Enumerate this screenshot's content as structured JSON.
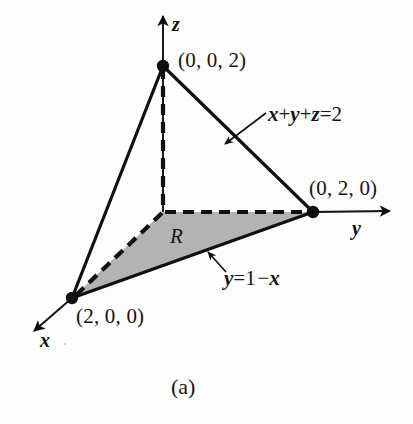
{
  "figure": {
    "caption": "(a)",
    "kind": "3d-coordinate-diagram",
    "background_color": "#fdfdfd",
    "stroke_color": "#101010",
    "shaded_region_color": "#b3b3b3"
  },
  "axes": [
    {
      "name": "z",
      "label": "z",
      "label_x": 172,
      "label_y": 14,
      "from_x": 163,
      "from_y": 212,
      "to_x": 163,
      "to_y": 16
    },
    {
      "name": "y",
      "label": "y",
      "label_x": 352,
      "label_y": 218,
      "from_x": 313,
      "from_y": 212,
      "to_x": 390,
      "to_y": 211
    },
    {
      "name": "x",
      "label": "x",
      "label_x": 40,
      "label_y": 330,
      "from_x": 72,
      "from_y": 298,
      "to_x": 34,
      "to_y": 331
    }
  ],
  "vertices": [
    {
      "name": "z-intercept",
      "label": "(0, 0, 2)",
      "px": 163,
      "py": 66,
      "label_x": 178,
      "label_y": 50
    },
    {
      "name": "y-intercept",
      "label": "(0, 2, 0)",
      "px": 313,
      "py": 212,
      "label_x": 309,
      "label_y": 178
    },
    {
      "name": "x-intercept",
      "label": "(2, 0, 0)",
      "px": 72,
      "py": 298,
      "label_x": 76,
      "label_y": 306
    },
    {
      "name": "origin",
      "label": "",
      "px": 163,
      "py": 212,
      "label_x": 0,
      "label_y": 0
    }
  ],
  "solid_edges": [
    {
      "name": "edge-z-to-y",
      "x1": 163,
      "y1": 66,
      "x2": 313,
      "y2": 212
    },
    {
      "name": "edge-z-to-x",
      "x1": 163,
      "y1": 66,
      "x2": 72,
      "y2": 298
    },
    {
      "name": "edge-x-to-y",
      "x1": 72,
      "y1": 298,
      "x2": 313,
      "y2": 212
    }
  ],
  "dashed_edges": [
    {
      "name": "dashed-z-axis-to-origin",
      "x1": 163,
      "y1": 68,
      "x2": 163,
      "y2": 210
    },
    {
      "name": "dashed-origin-to-y",
      "x1": 165,
      "y1": 212,
      "x2": 311,
      "y2": 212
    },
    {
      "name": "dashed-origin-to-x",
      "x1": 162,
      "y1": 213,
      "x2": 74,
      "y2": 297
    }
  ],
  "shaded_region": {
    "name": "region-R",
    "label": "R",
    "label_x": 170,
    "label_y": 226,
    "polygon": "72,298 163,212 313,212",
    "fill": "#b3b3b3"
  },
  "annotations": [
    {
      "name": "plane-equation",
      "text_html": "<i>x</i>+<i>y</i>+<i>z</i>=2",
      "text_plain": "x+y+z=2",
      "label_x": 268,
      "label_y": 104,
      "leader": {
        "x1": 266,
        "y1": 113,
        "x2": 225,
        "y2": 144
      }
    },
    {
      "name": "line-equation",
      "text_html": "<i>y</i>=1&#8202;&#8722;<i>x</i>",
      "text_plain": "y=1-x",
      "label_x": 224,
      "label_y": 268,
      "leader": {
        "x1": 226,
        "y1": 272,
        "x2": 208,
        "y2": 252
      }
    }
  ]
}
